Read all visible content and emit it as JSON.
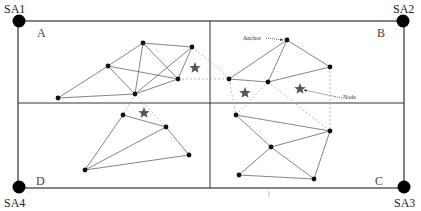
{
  "diagram": {
    "type": "wireless-sensor-network-localization",
    "colors": {
      "border": "#333333",
      "edge": "#666666",
      "dashed_edge": "#aaaaaa",
      "node": "#111111",
      "star": "#555555",
      "background": "#ffffff"
    },
    "frame": {
      "x1": 18,
      "y1": 21,
      "x2": 404,
      "y2": 188,
      "mid_x": 210,
      "mid_y": 103
    },
    "corner_anchors": [
      {
        "id": "SA1",
        "label": "SA1",
        "x": 19,
        "y": 21,
        "label_x": 4,
        "label_y": 3
      },
      {
        "id": "SA2",
        "label": "SA2",
        "x": 403,
        "y": 21,
        "label_x": 393,
        "label_y": 3
      },
      {
        "id": "SA3",
        "label": "SA3",
        "x": 404,
        "y": 187,
        "label_x": 394,
        "label_y": 197
      },
      {
        "id": "SA4",
        "label": "SA4",
        "x": 19,
        "y": 187,
        "label_x": 4,
        "label_y": 197
      }
    ],
    "regions": [
      {
        "id": "A",
        "label": "A",
        "label_x": 37,
        "label_y": 27
      },
      {
        "id": "B",
        "label": "B",
        "label_x": 377,
        "label_y": 27
      },
      {
        "id": "C",
        "label": "C",
        "label_x": 375,
        "label_y": 175
      },
      {
        "id": "D",
        "label": "D",
        "label_x": 36,
        "label_y": 175
      }
    ],
    "nodes": [
      {
        "id": "a1",
        "x": 58,
        "y": 98
      },
      {
        "id": "a2",
        "x": 108,
        "y": 66
      },
      {
        "id": "a3",
        "x": 143,
        "y": 43
      },
      {
        "id": "a4",
        "x": 192,
        "y": 47
      },
      {
        "id": "a5",
        "x": 178,
        "y": 79
      },
      {
        "id": "a6",
        "x": 135,
        "y": 94
      },
      {
        "id": "b1",
        "x": 287,
        "y": 40
      },
      {
        "id": "b2",
        "x": 229,
        "y": 79
      },
      {
        "id": "b3",
        "x": 268,
        "y": 82
      },
      {
        "id": "b4",
        "x": 330,
        "y": 67
      },
      {
        "id": "d1",
        "x": 123,
        "y": 115
      },
      {
        "id": "d2",
        "x": 166,
        "y": 127
      },
      {
        "id": "d3",
        "x": 189,
        "y": 155
      },
      {
        "id": "d4",
        "x": 85,
        "y": 170
      },
      {
        "id": "c1",
        "x": 236,
        "y": 115
      },
      {
        "id": "c2",
        "x": 330,
        "y": 131
      },
      {
        "id": "c3",
        "x": 271,
        "y": 147
      },
      {
        "id": "c4",
        "x": 239,
        "y": 175
      },
      {
        "id": "c5",
        "x": 314,
        "y": 179
      }
    ],
    "edges": [
      [
        "a1",
        "a2"
      ],
      [
        "a1",
        "a6"
      ],
      [
        "a2",
        "a3"
      ],
      [
        "a2",
        "a5"
      ],
      [
        "a2",
        "a6"
      ],
      [
        "a3",
        "a4"
      ],
      [
        "a3",
        "a5"
      ],
      [
        "a3",
        "a6"
      ],
      [
        "a4",
        "a5"
      ],
      [
        "a4",
        "a6"
      ],
      [
        "a5",
        "a6"
      ],
      [
        "b1",
        "b2"
      ],
      [
        "b1",
        "b3"
      ],
      [
        "b1",
        "b4"
      ],
      [
        "b2",
        "b3"
      ],
      [
        "b3",
        "b4"
      ],
      [
        "d1",
        "d2"
      ],
      [
        "d1",
        "d4"
      ],
      [
        "d2",
        "d4"
      ],
      [
        "d2",
        "d3"
      ],
      [
        "d3",
        "d4"
      ],
      [
        "c1",
        "c2"
      ],
      [
        "c1",
        "c3"
      ],
      [
        "c2",
        "c3"
      ],
      [
        "c2",
        "c5"
      ],
      [
        "c3",
        "c4"
      ],
      [
        "c3",
        "c5"
      ],
      [
        "c4",
        "c5"
      ]
    ],
    "dashed_edges": [
      [
        [
          192,
          47
        ],
        [
          218,
          68
        ],
        [
          229,
          79
        ]
      ],
      [
        [
          178,
          79
        ],
        [
          229,
          79
        ]
      ],
      [
        [
          135,
          94
        ],
        [
          123,
          115
        ]
      ],
      [
        [
          135,
          94
        ],
        [
          166,
          127
        ]
      ],
      [
        [
          229,
          79
        ],
        [
          236,
          115
        ]
      ],
      [
        [
          268,
          82
        ],
        [
          236,
          115
        ]
      ],
      [
        [
          268,
          82
        ],
        [
          330,
          131
        ]
      ],
      [
        [
          330,
          67
        ],
        [
          330,
          131
        ]
      ]
    ],
    "stars": [
      {
        "id": "unknown-a",
        "x": 195,
        "y": 68
      },
      {
        "id": "unknown-d",
        "x": 144,
        "y": 113
      },
      {
        "id": "unknown-b1",
        "x": 245,
        "y": 93
      },
      {
        "id": "unknown-b2",
        "x": 300,
        "y": 89
      }
    ],
    "annotations": [
      {
        "id": "anchor-callout",
        "text": "Anchor",
        "label_x": 243,
        "label_y": 35,
        "from": [
          266,
          38
        ],
        "to": [
          283,
          40
        ]
      },
      {
        "id": "node-callout",
        "text": "Node",
        "label_x": 343,
        "label_y": 94,
        "from": [
          342,
          98
        ],
        "to": [
          304,
          90
        ]
      }
    ],
    "tick_mark": {
      "x": 269,
      "y1": 191,
      "y2": 197
    }
  }
}
